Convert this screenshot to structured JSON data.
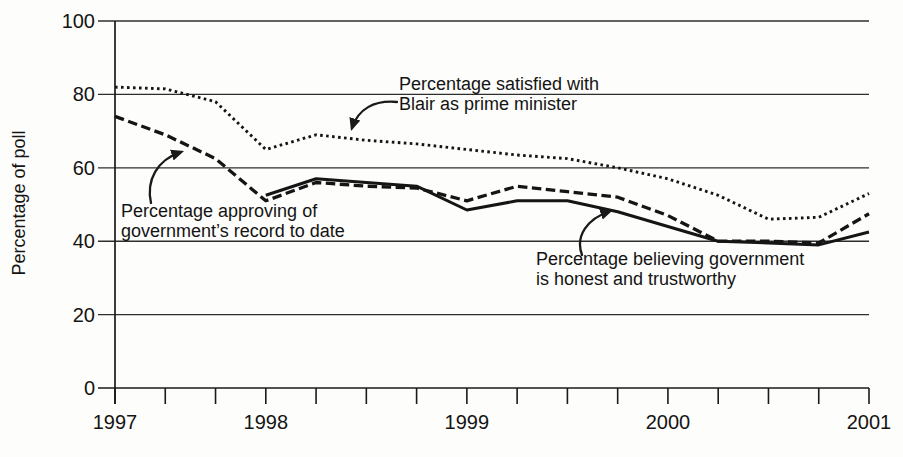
{
  "chart_data": {
    "type": "line",
    "ylabel": "Percentage of poll",
    "ylim": [
      0,
      100
    ],
    "yticks": [
      0,
      20,
      40,
      60,
      80,
      100
    ],
    "xlim": [
      1997.25,
      2001
    ],
    "xticks": [
      1997.25,
      1998,
      1999,
      2000,
      2001
    ],
    "xtick_labels": [
      "1997",
      "1998",
      "1999",
      "2000",
      "2001"
    ],
    "xtick_minor_step": 0.25,
    "grid": "horizontal",
    "legend": "none (inline annotations with arrows)",
    "ink_color": "#151515",
    "background_color": "#fdfdfb",
    "series": [
      {
        "name": "satisfied_with_blair",
        "label": "Percentage satisfied with Blair as prime minister",
        "style": "dotted",
        "x": [
          1997.25,
          1997.5,
          1997.75,
          1998,
          1998.25,
          1998.5,
          1998.75,
          1999,
          1999.25,
          1999.5,
          1999.75,
          2000,
          2000.25,
          2000.5,
          2000.75,
          2001
        ],
        "y": [
          82,
          81.5,
          78,
          65,
          69,
          67.5,
          66.5,
          65,
          63.5,
          62.5,
          60,
          57,
          52.5,
          46,
          46.5,
          53
        ]
      },
      {
        "name": "approving_record",
        "label": "Percentage approving of government’s record to date",
        "style": "dashed",
        "x": [
          1997.25,
          1997.5,
          1997.75,
          1998,
          1998.25,
          1998.5,
          1998.75,
          1999,
          1999.25,
          1999.5,
          1999.75,
          2000,
          2000.25,
          2000.5,
          2000.75,
          2001
        ],
        "y": [
          74,
          69,
          62.5,
          51,
          56,
          55,
          54.5,
          51,
          55,
          53.5,
          52,
          47,
          40,
          40,
          39.5,
          47.5
        ]
      },
      {
        "name": "honest_trustworthy",
        "label": "Percentage believing government is honest and trustworthy",
        "style": "solid",
        "x": [
          1998,
          1998.25,
          1998.5,
          1998.75,
          1999,
          1999.25,
          1999.5,
          1999.75,
          2000,
          2000.25,
          2000.5,
          2000.75,
          2001
        ],
        "y": [
          52.5,
          57,
          56,
          55,
          48.5,
          51,
          51,
          48,
          44,
          40,
          39.5,
          39,
          42.5
        ]
      }
    ],
    "annotations": [
      {
        "target": "satisfied_with_blair",
        "line1": "Percentage satisfied with",
        "line2": "Blair as prime minister"
      },
      {
        "target": "approving_record",
        "line1": "Percentage approving of",
        "line2": "government’s record to date"
      },
      {
        "target": "honest_trustworthy",
        "line1": "Percentage believing government",
        "line2": "is honest and trustworthy"
      }
    ]
  }
}
